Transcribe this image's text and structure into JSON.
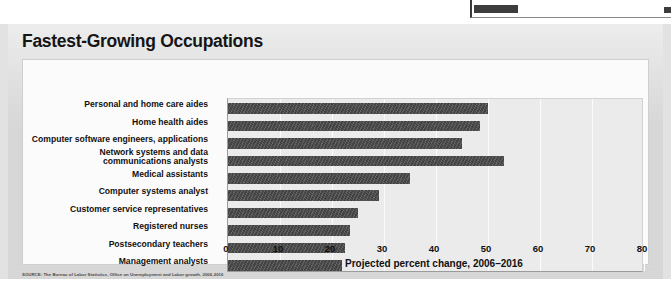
{
  "figure": {
    "title": "Fastest-Growing Occupations",
    "source": "SOURCE: The Bureau of Labor Statistics, Office on Unemployment and Labor growth, 2006-2016"
  },
  "top_fragment": {
    "name": "cut-off-bar-from-previous-figure"
  },
  "chart_data": {
    "type": "bar",
    "orientation": "horizontal",
    "title": "Fastest-Growing Occupations",
    "xlabel": "Projected percent change, 2006–2016",
    "ylabel": "",
    "xlim": [
      0,
      80
    ],
    "xticks": [
      0,
      10,
      20,
      30,
      40,
      50,
      60,
      70,
      80
    ],
    "xtick_labels": [
      "0",
      "10",
      "20",
      "30",
      "40",
      "50",
      "60",
      "70",
      "80"
    ],
    "grid": true,
    "grid_axis": "x",
    "legend": false,
    "bar_color": "#4a4a4a",
    "plot_bg": "#ebebeb",
    "categories": [
      "Personal and home care aides",
      "Home health aides",
      "Computer software engineers, applications",
      "Network systems and data\ncommunications analysts",
      "Medical assistants",
      "Computer systems analyst",
      "Customer service representatives",
      "Registered nurses",
      "Postsecondary teachers",
      "Management analysts"
    ],
    "values": [
      50,
      48.5,
      45,
      53,
      35,
      29,
      25,
      23.5,
      22.5,
      22
    ]
  }
}
